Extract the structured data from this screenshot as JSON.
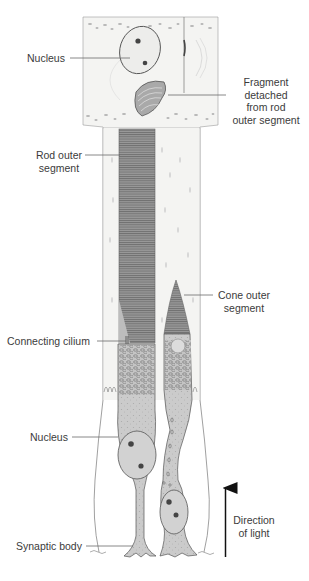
{
  "figure": {
    "colors": {
      "background": "#ffffff",
      "tissue": "#f1f1ef",
      "cell_fill": "#c9c9c9",
      "outer_segment": "#8e8e8e",
      "outline": "#555555",
      "nucleus_fill": "#d6d6d6",
      "arrow": "#111111",
      "label_text": "#3b3b3b"
    },
    "labels": {
      "nucleus_top": "Nucleus",
      "fragment": [
        "Fragment",
        "detached",
        "from rod",
        "outer segment"
      ],
      "rod_outer_segment": [
        "Rod outer",
        "segment"
      ],
      "cone_outer_segment": [
        "Cone outer",
        "segment"
      ],
      "connecting_cilium": "Connecting cilium",
      "nucleus_bottom": "Nucleus",
      "synaptic_body": "Synaptic body",
      "direction_of_light": [
        "Direction",
        "of light"
      ]
    }
  }
}
